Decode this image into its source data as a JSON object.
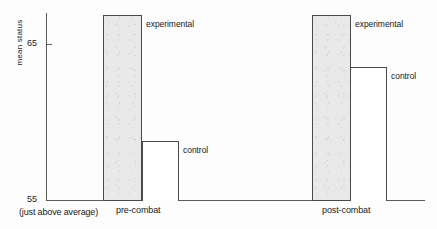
{
  "chart_data": {
    "type": "bar",
    "title": "",
    "subtitle": "",
    "xlabel": "",
    "ylabel": "mean status",
    "ylim": [
      55,
      67.1
    ],
    "yticks": [
      55,
      65
    ],
    "ytick_labels": [
      "55",
      "65"
    ],
    "grid": false,
    "legend_position": "inline-annotations",
    "axis_note": "(just above average)",
    "categories": [
      "pre-combat",
      "post-combat"
    ],
    "series": [
      {
        "name": "experimental",
        "values": [
          67.0,
          67.0
        ],
        "fill": "#e9e9e9",
        "stroke": "#4a4a4a"
      },
      {
        "name": "control",
        "values": [
          58.8,
          63.6
        ],
        "fill": "#ffffff",
        "stroke": "#4a4a4a"
      }
    ],
    "annotations": [
      {
        "text": "experimental",
        "group": "pre-combat"
      },
      {
        "text": "control",
        "group": "pre-combat"
      },
      {
        "text": "experimental",
        "group": "post-combat"
      },
      {
        "text": "control",
        "group": "post-combat"
      }
    ]
  },
  "axis": {
    "y_title": "mean status",
    "tick_65": "65",
    "tick_55": "55",
    "baseline_note": "(just above average)"
  },
  "groups": {
    "pre_combat": {
      "label": "pre-combat",
      "experimental_label": "experimental",
      "control_label": "control"
    },
    "post_combat": {
      "label": "post-combat",
      "experimental_label": "experimental",
      "control_label": "control"
    }
  },
  "colors": {
    "axis": "#5d5d5d",
    "bar_stroke": "#4a4a4a",
    "experimental_fill": "#e9e9e9",
    "control_fill": "#ffffff",
    "text": "#1a1a1a"
  }
}
